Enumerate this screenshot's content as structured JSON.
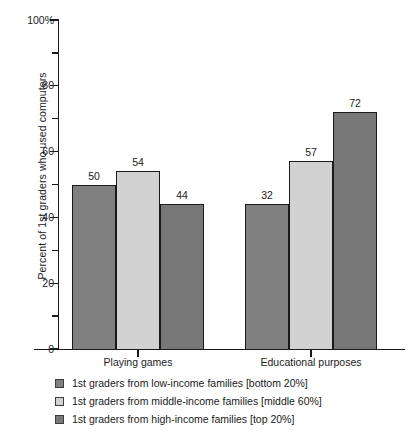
{
  "chart_data": {
    "type": "bar",
    "title": "",
    "subtitle": "",
    "xlabel": "",
    "ylabel": "Percent of 1st graders who used computers",
    "categories": [
      "Playing games",
      "Educational purposes"
    ],
    "series": [
      {
        "name": "1st graders from low-income families [bottom 20%]",
        "color": "#808080",
        "values": [
          50,
          44
        ]
      },
      {
        "name": "1st graders from middle-income families [middle 60%]",
        "color": "#d2d2d2",
        "values": [
          54,
          57
        ]
      },
      {
        "name": "1st graders from high-income families [top 20%]",
        "color": "#787878",
        "values": [
          44,
          72
        ]
      }
    ],
    "bars": [
      {
        "category": "Playing games",
        "series": "low-income",
        "value": 50,
        "label": "50",
        "color": "#808080"
      },
      {
        "category": "Playing games",
        "series": "middle-income",
        "value": 54,
        "label": "54",
        "color": "#d2d2d2"
      },
      {
        "category": "Playing games",
        "series": "high-income",
        "value": 44,
        "label": "44",
        "color": "#787878"
      },
      {
        "category": "Educational purposes",
        "series": "low-income",
        "value": 32,
        "label": "32",
        "color": "#808080"
      },
      {
        "category": "Educational purposes",
        "series": "middle-income",
        "value": 57,
        "label": "57",
        "color": "#d2d2d2"
      },
      {
        "category": "Educational purposes",
        "series": "high-income",
        "value": 72,
        "label": "72",
        "color": "#787878"
      }
    ],
    "ylim": [
      0,
      100
    ],
    "major_ticks": [
      {
        "value": 100,
        "label": "100%"
      },
      {
        "value": 80,
        "label": "80"
      },
      {
        "value": 60,
        "label": "60"
      },
      {
        "value": 40,
        "label": "40"
      },
      {
        "value": 20,
        "label": "20"
      },
      {
        "value": 0,
        "label": "0"
      }
    ],
    "minor_ticks": [
      90,
      70,
      50,
      30,
      10
    ],
    "grid": false,
    "legend_position": "bottom-left"
  },
  "axis": {
    "y_title": "Percent of 1st graders who used computers",
    "tick_100": "100%",
    "tick_80": "80",
    "tick_60": "60",
    "tick_40": "40",
    "tick_20": "20",
    "tick_0": "0"
  },
  "categories": {
    "cat_0": "Playing games",
    "cat_1": "Educational purposes"
  },
  "values": {
    "games_low": "50",
    "games_mid": "54",
    "games_high": "44",
    "edu_low": "32",
    "edu_mid": "57",
    "edu_high": "72"
  },
  "legend": {
    "items": [
      {
        "label": "1st graders from low-income families [bottom 20%]",
        "color": "#808080"
      },
      {
        "label": "1st graders from middle-income families [middle 60%]",
        "color": "#d2d2d2"
      },
      {
        "label": "1st graders from high-income families [top 20%]",
        "color": "#787878"
      }
    ]
  },
  "colors": {
    "low_income": "#808080",
    "middle_income": "#d2d2d2",
    "high_income": "#787878",
    "axis": "#1a1a1a",
    "background": "#ffffff"
  }
}
